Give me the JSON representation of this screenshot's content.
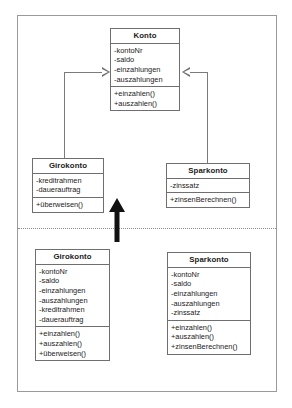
{
  "diagram": {
    "type": "uml-class-diagram",
    "sections": [
      {
        "id": "top",
        "name": "inheritance-model",
        "classes": [
          "konto",
          "girokonto_top",
          "sparkonto_top"
        ]
      },
      {
        "id": "bottom",
        "name": "flattened-model",
        "classes": [
          "girokonto_bottom",
          "sparkonto_bottom"
        ]
      }
    ],
    "relationships": [
      {
        "type": "generalization",
        "from": "girokonto_top",
        "to": "konto",
        "arrow": "hollow-triangle"
      },
      {
        "type": "generalization",
        "from": "sparkonto_top",
        "to": "konto",
        "arrow": "hollow-triangle"
      },
      {
        "type": "transformation",
        "direction": "up",
        "arrow": "solid-block-arrow"
      }
    ],
    "separator": "dotted-horizontal-line"
  },
  "classes": {
    "konto": {
      "name": "Konto",
      "attributes": [
        "-kontoNr",
        "-saldo",
        "-einzahlungen",
        "-auszahlungen"
      ],
      "methods": [
        "+einzahlen()",
        "+auszahlen()"
      ]
    },
    "girokonto_top": {
      "name": "Girokonto",
      "attributes": [
        "-kreditrahmen",
        "-dauerauftrag"
      ],
      "methods": [
        "+überweisen()"
      ]
    },
    "sparkonto_top": {
      "name": "Sparkonto",
      "attributes": [
        "-zinssatz"
      ],
      "methods": [
        "+zinsenBerechnen()"
      ]
    },
    "girokonto_bottom": {
      "name": "Girokonto",
      "attributes": [
        "-kontoNr",
        "-saldo",
        "-einzahlungen",
        "-auszahlungen",
        "-kreditrahmen",
        "-dauerauftrag"
      ],
      "methods": [
        "+einzahlen()",
        "+auszahlen()",
        "+überweisen()"
      ]
    },
    "sparkonto_bottom": {
      "name": "Sparkonto",
      "attributes": [
        "-kontoNr",
        "-saldo",
        "-einzahlungen",
        "-auszahlungen",
        "-zinssatz"
      ],
      "methods": [
        "+einzahlen()",
        "+auszahlen()",
        "+zinsenBerechnen()"
      ]
    }
  },
  "colors": {
    "background": "#ffffff",
    "frame_border": "#9a9a9a",
    "class_border": "#6f6f6f",
    "connector": "#7b7b7b",
    "arrow_fill": "#111111",
    "text": "#1a1a1a"
  }
}
